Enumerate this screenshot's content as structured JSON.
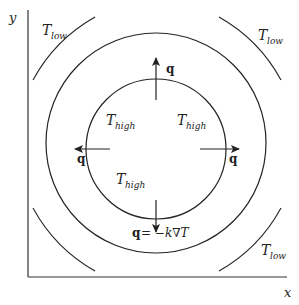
{
  "diagram": {
    "axes": {
      "x_label": "x",
      "y_label": "y"
    },
    "isotherms": {
      "low_label_base": "T",
      "low_label_sub": "low",
      "high_label_base": "T",
      "high_label_sub": "high"
    },
    "flux": {
      "vector_label": "q",
      "law_lhs": "q",
      "law_rhs": " = −k∇T"
    },
    "colors": {
      "line": "#222222",
      "background": "#ffffff"
    }
  }
}
